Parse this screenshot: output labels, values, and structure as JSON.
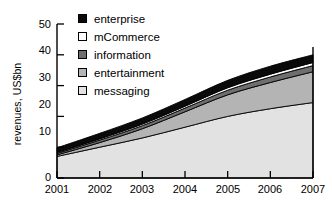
{
  "chart_data": {
    "type": "area",
    "stacked": true,
    "title": "",
    "subtitle": "",
    "xlabel": "",
    "ylabel": "revenues, US$bn",
    "categories": [
      "2001",
      "2002",
      "2003",
      "2004",
      "2005",
      "2006",
      "2007"
    ],
    "x": [
      2001,
      2002,
      2003,
      2004,
      2005,
      2006,
      2007
    ],
    "xlim": [
      2001,
      2007
    ],
    "ylim": [
      0,
      50
    ],
    "yticks": [
      0,
      10,
      20,
      30,
      40,
      50
    ],
    "xticks": [
      "2001",
      "2002",
      "2003",
      "2004",
      "2005",
      "2006",
      "2007"
    ],
    "grid": false,
    "legend_position": "top-left-inside",
    "stack_order_bottom_to_top": [
      "messaging",
      "entertainment",
      "information",
      "mCommerce",
      "enterprise"
    ],
    "series": [
      {
        "name": "enterprise",
        "color": "#0a0a0a",
        "values": [
          1.5,
          1.8,
          2.0,
          2.2,
          2.4,
          2.6,
          2.5
        ]
      },
      {
        "name": "mCommerce",
        "color": "#ffffff",
        "values": [
          0.3,
          0.4,
          0.5,
          0.6,
          0.8,
          0.9,
          1.0
        ]
      },
      {
        "name": "information",
        "color": "#6e6e6e",
        "values": [
          0.5,
          0.8,
          1.0,
          1.2,
          1.5,
          1.8,
          2.0
        ]
      },
      {
        "name": "entertainment",
        "color": "#b4b4b4",
        "values": [
          0.5,
          1.5,
          3.0,
          5.0,
          7.0,
          8.5,
          10.0
        ]
      },
      {
        "name": "messaging",
        "color": "#e2e2e2",
        "values": [
          7.0,
          10.0,
          13.0,
          16.5,
          20.0,
          22.5,
          24.5
        ]
      }
    ],
    "totals": [
      9.8,
      14.5,
      19.5,
      25.5,
      31.7,
      36.3,
      40.0
    ],
    "annotations": []
  },
  "legend": {
    "items": [
      {
        "label": "enterprise",
        "color": "#0a0a0a"
      },
      {
        "label": "mCommerce",
        "color": "#ffffff"
      },
      {
        "label": "information",
        "color": "#6e6e6e"
      },
      {
        "label": "entertainment",
        "color": "#b4b4b4"
      },
      {
        "label": "messaging",
        "color": "#e2e2e2"
      }
    ]
  },
  "axes": {
    "y_label": "revenues, US$bn",
    "y_ticks": [
      "50",
      "40",
      "30",
      "20",
      "10",
      "0"
    ],
    "x_ticks": [
      "2001",
      "2002",
      "2003",
      "2004",
      "2005",
      "2006",
      "2007"
    ]
  },
  "colors": {
    "axis": "#000000",
    "background": "#ffffff",
    "enterprise": "#0a0a0a",
    "mCommerce": "#ffffff",
    "information": "#6e6e6e",
    "entertainment": "#b4b4b4",
    "messaging": "#e2e2e2"
  }
}
